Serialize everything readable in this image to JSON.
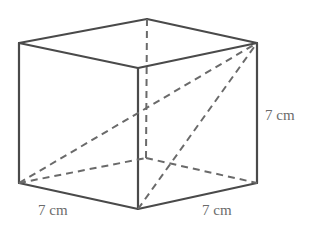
{
  "figure": {
    "type": "cube",
    "colors": {
      "solid_edge": "#4a4a4a",
      "hidden_edge": "#6a6a6a",
      "label": "#6b6b6b",
      "background": "#ffffff"
    },
    "vertices": {
      "top_left": [
        19,
        43
      ],
      "top_back": [
        147,
        19
      ],
      "top_right": [
        257,
        43
      ],
      "top_front": [
        138,
        68
      ],
      "bottom_left": [
        19,
        183
      ],
      "bottom_back": [
        146,
        158
      ],
      "bottom_right": [
        257,
        183
      ],
      "bottom_front": [
        138,
        209
      ]
    },
    "labels": {
      "front_left_edge": "7 cm",
      "front_right_edge": "7 cm",
      "right_vertical_edge": "7 cm"
    }
  }
}
